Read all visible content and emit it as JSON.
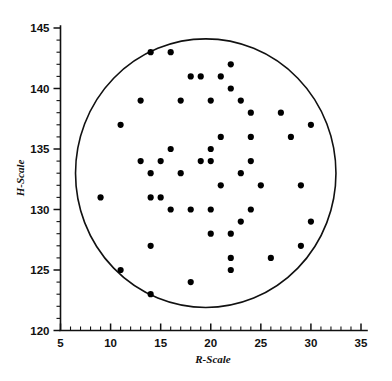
{
  "chart_data": {
    "type": "scatter",
    "title": "",
    "xlabel": "R-Scale",
    "ylabel": "H-Scale",
    "xlim": [
      5,
      35
    ],
    "ylim": [
      120,
      145
    ],
    "x_major_ticks": [
      5,
      10,
      15,
      20,
      25,
      30,
      35
    ],
    "y_major_ticks": [
      120,
      125,
      130,
      135,
      140,
      145
    ],
    "x_tick_labels": [
      "5",
      "10",
      "15",
      "20",
      "25",
      "30",
      "35"
    ],
    "y_tick_labels": [
      "120",
      "125",
      "130",
      "135",
      "140",
      "145"
    ],
    "x_minor_step": 1,
    "y_minor_step": 1,
    "grid": false,
    "legend": null,
    "marker": "filled-circle",
    "marker_color": "#000000",
    "marker_size_px": 3.1,
    "points": [
      [
        14,
        143
      ],
      [
        16,
        143
      ],
      [
        22,
        142
      ],
      [
        18,
        141
      ],
      [
        19,
        141
      ],
      [
        21,
        141
      ],
      [
        22,
        140
      ],
      [
        13,
        139
      ],
      [
        17,
        139
      ],
      [
        20,
        139
      ],
      [
        23,
        139
      ],
      [
        24,
        138
      ],
      [
        27,
        138
      ],
      [
        11,
        137
      ],
      [
        30,
        137
      ],
      [
        21,
        136
      ],
      [
        24,
        136
      ],
      [
        28,
        136
      ],
      [
        16,
        135
      ],
      [
        20,
        135
      ],
      [
        13,
        134
      ],
      [
        15,
        134
      ],
      [
        19,
        134
      ],
      [
        20,
        134
      ],
      [
        24,
        134
      ],
      [
        14,
        133
      ],
      [
        17,
        133
      ],
      [
        23,
        133
      ],
      [
        21,
        132
      ],
      [
        25,
        132
      ],
      [
        29,
        132
      ],
      [
        9,
        131
      ],
      [
        14,
        131
      ],
      [
        15,
        131
      ],
      [
        16,
        130
      ],
      [
        18,
        130
      ],
      [
        20,
        130
      ],
      [
        24,
        130
      ],
      [
        23,
        129
      ],
      [
        30,
        129
      ],
      [
        20,
        128
      ],
      [
        22,
        128
      ],
      [
        14,
        127
      ],
      [
        29,
        127
      ],
      [
        22,
        126
      ],
      [
        26,
        126
      ],
      [
        11,
        125
      ],
      [
        22,
        125
      ],
      [
        18,
        124
      ],
      [
        14,
        123
      ]
    ],
    "boundary": {
      "shape": "ellipse",
      "center": [
        19.5,
        133.0
      ],
      "radius_x": 13.0,
      "radius_y": 11.1,
      "stroke": "#111111"
    }
  },
  "figure": {
    "background": "#ffffff",
    "axis_color": "#111111"
  }
}
